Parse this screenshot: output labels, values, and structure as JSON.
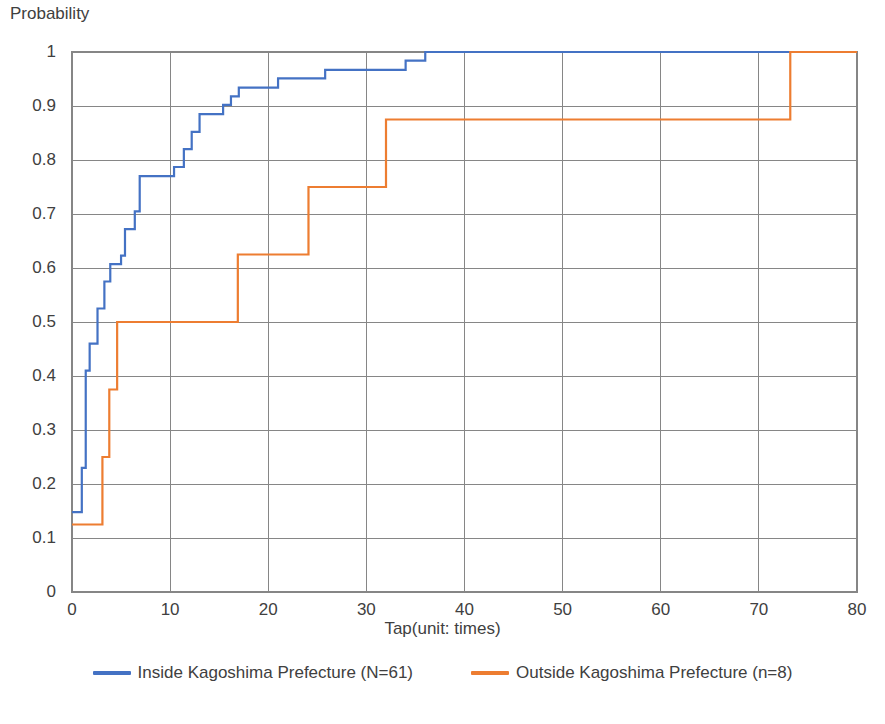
{
  "chart_data": {
    "type": "line",
    "subtype": "step-cumulative-distribution",
    "title": "",
    "xlabel": "Tap(unit: times)",
    "ylabel": "Probability",
    "xlim": [
      0,
      80
    ],
    "ylim": [
      0,
      1
    ],
    "xticks": [
      0,
      10,
      20,
      30,
      40,
      50,
      60,
      70,
      80
    ],
    "xtick_labels": [
      "0",
      "10",
      "20",
      "30",
      "40",
      "50",
      "60",
      "70",
      "80"
    ],
    "yticks": [
      0,
      0.1,
      0.2,
      0.3,
      0.4,
      0.5,
      0.6,
      0.7,
      0.8,
      0.9,
      1
    ],
    "ytick_labels": [
      "0",
      "0.1",
      "0.2",
      "0.3",
      "0.4",
      "0.5",
      "0.6",
      "0.7",
      "0.8",
      "0.9",
      "1"
    ],
    "grid": true,
    "grid_axes": "both",
    "grid_color": "#868686",
    "legend_position": "bottom",
    "series": [
      {
        "name": "Inside Kagoshima Prefecture (N=61)",
        "color": "#4472C4",
        "line_width": 2.2,
        "points": [
          [
            0,
            0.148
          ],
          [
            1,
            0.148
          ],
          [
            1,
            0.23
          ],
          [
            1.4,
            0.23
          ],
          [
            1.4,
            0.41
          ],
          [
            1.8,
            0.41
          ],
          [
            1.8,
            0.46
          ],
          [
            2.6,
            0.46
          ],
          [
            2.6,
            0.525
          ],
          [
            3.3,
            0.525
          ],
          [
            3.3,
            0.575
          ],
          [
            3.9,
            0.575
          ],
          [
            3.9,
            0.607
          ],
          [
            5.0,
            0.607
          ],
          [
            5.0,
            0.623
          ],
          [
            5.4,
            0.623
          ],
          [
            5.4,
            0.672
          ],
          [
            6.4,
            0.672
          ],
          [
            6.4,
            0.705
          ],
          [
            6.9,
            0.705
          ],
          [
            6.9,
            0.77
          ],
          [
            10.4,
            0.77
          ],
          [
            10.4,
            0.787
          ],
          [
            11.4,
            0.787
          ],
          [
            11.4,
            0.82
          ],
          [
            12.2,
            0.82
          ],
          [
            12.2,
            0.852
          ],
          [
            13.0,
            0.852
          ],
          [
            13.0,
            0.885
          ],
          [
            15.4,
            0.885
          ],
          [
            15.4,
            0.902
          ],
          [
            16.2,
            0.902
          ],
          [
            16.2,
            0.918
          ],
          [
            17.0,
            0.918
          ],
          [
            17.0,
            0.934
          ],
          [
            21.0,
            0.934
          ],
          [
            21.0,
            0.951
          ],
          [
            25.8,
            0.951
          ],
          [
            25.8,
            0.967
          ],
          [
            34.0,
            0.967
          ],
          [
            34.0,
            0.984
          ],
          [
            36.0,
            0.984
          ],
          [
            36.0,
            1.0
          ],
          [
            73.2,
            1.0
          ]
        ]
      },
      {
        "name": "Outside Kagoshima Prefecture (n=8)",
        "color": "#ED7D31",
        "line_width": 2.2,
        "points": [
          [
            0,
            0.125
          ],
          [
            3.1,
            0.125
          ],
          [
            3.1,
            0.25
          ],
          [
            3.8,
            0.25
          ],
          [
            3.8,
            0.375
          ],
          [
            4.6,
            0.375
          ],
          [
            4.6,
            0.5
          ],
          [
            16.9,
            0.5
          ],
          [
            16.9,
            0.625
          ],
          [
            24.1,
            0.625
          ],
          [
            24.1,
            0.75
          ],
          [
            32.0,
            0.75
          ],
          [
            32.0,
            0.875
          ],
          [
            73.2,
            0.875
          ],
          [
            73.2,
            1.0
          ],
          [
            80,
            1.0
          ]
        ]
      }
    ]
  },
  "legend": {
    "entries": [
      {
        "label": "Inside Kagoshima Prefecture (N=61)",
        "color": "#4472C4"
      },
      {
        "label": "Outside Kagoshima Prefecture (n=8)",
        "color": "#ED7D31"
      }
    ]
  }
}
